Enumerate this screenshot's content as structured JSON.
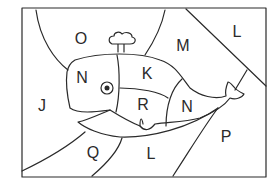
{
  "puzzle": {
    "type": "color-by-letter",
    "subject": "whale",
    "line_color": "#2a2a2a",
    "background": "#ffffff",
    "regions": [
      {
        "id": "O",
        "label": "O",
        "x": 81,
        "y": 39
      },
      {
        "id": "M",
        "label": "M",
        "x": 183,
        "y": 46
      },
      {
        "id": "L-top",
        "label": "L",
        "x": 237,
        "y": 32
      },
      {
        "id": "N-head",
        "label": "N",
        "x": 82,
        "y": 78
      },
      {
        "id": "K",
        "label": "K",
        "x": 147,
        "y": 74
      },
      {
        "id": "J",
        "label": "J",
        "x": 42,
        "y": 106
      },
      {
        "id": "R",
        "label": "R",
        "x": 143,
        "y": 105
      },
      {
        "id": "N-tail",
        "label": "N",
        "x": 187,
        "y": 107
      },
      {
        "id": "P",
        "label": "P",
        "x": 226,
        "y": 137
      },
      {
        "id": "Q",
        "label": "Q",
        "x": 93,
        "y": 153
      },
      {
        "id": "L-bottom",
        "label": "L",
        "x": 151,
        "y": 154
      }
    ]
  }
}
